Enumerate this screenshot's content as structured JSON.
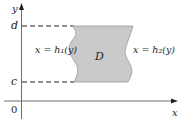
{
  "diagram": {
    "axes": {
      "x_label": "x",
      "y_label": "y",
      "origin_label": "0"
    },
    "levels": {
      "top": "d",
      "bottom": "c"
    },
    "region": {
      "label": "D",
      "fill": "#c8c9cb",
      "stroke": "#8a8a8a"
    },
    "boundaries": {
      "left": "x = h₁(y)",
      "right": "x = h₂(y)"
    },
    "colors": {
      "ink": "#231f20",
      "axis": "#6d6e71"
    }
  }
}
